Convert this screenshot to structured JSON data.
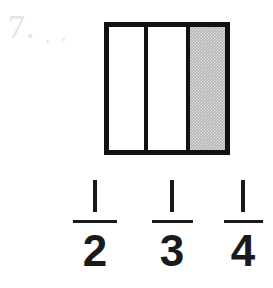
{
  "problem": {
    "number_label": "7.",
    "number_color": "#e3e3e3"
  },
  "diagram": {
    "type": "partitioned-rectangle",
    "total_parts": 3,
    "shaded_parts": 1,
    "border_color": "#111111",
    "shade_color": "#b4b4b4",
    "fill_color": "#ffffff",
    "cells": [
      {
        "label": "",
        "shaded": "false"
      },
      {
        "label": "",
        "shaded": "false"
      },
      {
        "label": "",
        "shaded": "true"
      }
    ]
  },
  "answer_choices": [
    {
      "numerator": "1",
      "denominator": "2"
    },
    {
      "numerator": "1",
      "denominator": "3"
    },
    {
      "numerator": "1",
      "denominator": "4"
    }
  ]
}
